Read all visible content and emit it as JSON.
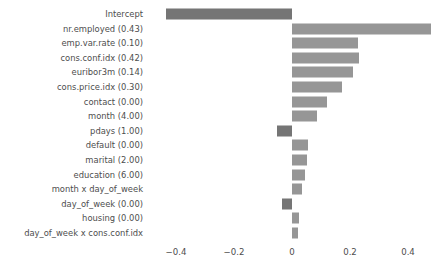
{
  "chart_data": {
    "type": "bar",
    "orientation": "horizontal",
    "title": "",
    "subtitle": "",
    "xlabel": "",
    "ylabel": "",
    "xlim": [
      -0.5,
      0.5
    ],
    "grid": false,
    "legend": null,
    "xticks": [
      "-0.4",
      "-0.2",
      "0",
      "0.2",
      "0.4"
    ],
    "xtick_values": [
      -0.4,
      -0.2,
      0,
      0.2,
      0.4
    ],
    "categories": [
      "Intercept",
      "nr.employed (0.43)",
      "emp.var.rate (0.10)",
      "cons.conf.idx (0.42)",
      "euribor3m (0.14)",
      "cons.price.idx (0.30)",
      "contact (0.00)",
      "month (4.00)",
      "pdays (1.00)",
      "default (0.00)",
      "marital (2.00)",
      "education (6.00)",
      "month x day_of_week",
      "day_of_week (0.00)",
      "housing (0.00)",
      "day_of_week x cons.conf.idx"
    ],
    "values": [
      -0.435,
      0.48,
      0.226,
      0.232,
      0.21,
      0.171,
      0.119,
      0.087,
      -0.052,
      0.055,
      0.052,
      0.045,
      0.035,
      -0.035,
      0.023,
      0.019
    ],
    "colors": {
      "positive_bar": "#969696",
      "negative_bar": "#757575",
      "background": "#ffffff",
      "text": "#4d4d4d"
    }
  }
}
